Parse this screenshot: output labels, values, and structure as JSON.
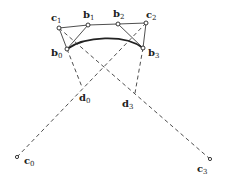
{
  "diagram": {
    "colors": {
      "ink": "#222222",
      "background": "#ffffff"
    },
    "points": {
      "c0": {
        "label": "c",
        "sub": "0",
        "x": 17,
        "y": 157
      },
      "c1": {
        "label": "c",
        "sub": "1",
        "x": 59,
        "y": 28
      },
      "c2": {
        "label": "c",
        "sub": "2",
        "x": 146,
        "y": 23
      },
      "c3": {
        "label": "c",
        "sub": "3",
        "x": 210,
        "y": 159
      },
      "b0": {
        "label": "b",
        "sub": "0",
        "x": 67,
        "y": 49
      },
      "b1": {
        "label": "b",
        "sub": "1",
        "x": 88,
        "y": 25
      },
      "b2": {
        "label": "b",
        "sub": "2",
        "x": 118,
        "y": 24
      },
      "b3": {
        "label": "b",
        "sub": "3",
        "x": 143,
        "y": 48
      },
      "d0": {
        "label": "d",
        "sub": "0",
        "x": 82,
        "y": 87
      },
      "d3": {
        "label": "d",
        "sub": "3",
        "x": 135,
        "y": 93
      }
    },
    "labels": [
      {
        "id": "c1",
        "text": "c",
        "sub": "1",
        "x": 51,
        "y": 21
      },
      {
        "id": "b1",
        "text": "b",
        "sub": "1",
        "x": 83,
        "y": 18
      },
      {
        "id": "b2",
        "text": "b",
        "sub": "2",
        "x": 113,
        "y": 17
      },
      {
        "id": "c2",
        "text": "c",
        "sub": "2",
        "x": 146,
        "y": 18
      },
      {
        "id": "b0",
        "text": "b",
        "sub": "0",
        "x": 51,
        "y": 56
      },
      {
        "id": "b3",
        "text": "b",
        "sub": "3",
        "x": 148,
        "y": 56
      },
      {
        "id": "d0",
        "text": "d",
        "sub": "0",
        "x": 79,
        "y": 101
      },
      {
        "id": "d3",
        "text": "d",
        "sub": "3",
        "x": 122,
        "y": 107
      },
      {
        "id": "c0",
        "text": "c",
        "sub": "0",
        "x": 24,
        "y": 164
      },
      {
        "id": "c3",
        "text": "c",
        "sub": "3",
        "x": 197,
        "y": 172
      }
    ]
  }
}
